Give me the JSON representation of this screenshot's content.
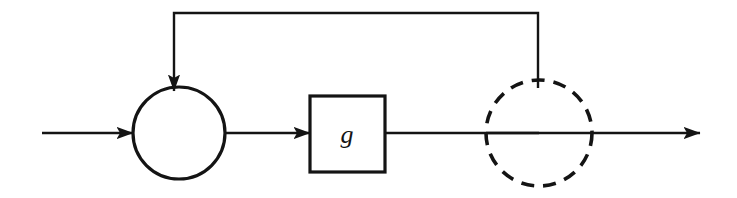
{
  "diagram": {
    "background_color": "#ffffff",
    "stroke_color": "#141414",
    "canvas": {
      "width": 737,
      "height": 198
    },
    "nodes": [
      {
        "id": "summing-junction",
        "type": "circle-solid",
        "role": "summing junction",
        "label": "",
        "cx": 179,
        "cy": 133,
        "r": 46,
        "stroke_width": 3.2,
        "stroke_style": "solid",
        "fill": "none"
      },
      {
        "id": "gain-block",
        "type": "rectangle",
        "role": "transfer function block",
        "label": "g",
        "x": 310,
        "y": 96,
        "width": 75,
        "height": 76,
        "stroke_width": 3.2,
        "stroke_style": "solid",
        "fill": "none"
      },
      {
        "id": "pickoff-point",
        "type": "circle-dashed",
        "role": "branch / pickoff point",
        "label": "",
        "cx": 539,
        "cy": 133,
        "r": 53,
        "stroke_width": 3.6,
        "stroke_style": "dashed",
        "dash_pattern": "13 9",
        "fill": "none"
      }
    ],
    "edges": [
      {
        "id": "input-edge",
        "from": "input",
        "to": "summing-junction",
        "arrowhead": true,
        "path": "M 42 133 L 133 133"
      },
      {
        "id": "summing-to-gain-edge",
        "from": "summing-junction",
        "to": "gain-block",
        "arrowhead": true,
        "path": "M 225 133 L 310 133"
      },
      {
        "id": "gain-to-pickoff-edge",
        "from": "gain-block",
        "to": "pickoff-point",
        "arrowhead": false,
        "path": "M 385 133 L 539 133"
      },
      {
        "id": "output-edge",
        "from": "pickoff-point",
        "to": "output",
        "arrowhead": true,
        "path": "M 486 133 L 700 133"
      },
      {
        "id": "feedback-edge",
        "from": "pickoff-point",
        "to": "summing-junction",
        "arrowhead": true,
        "path": "M 538 88 L 538 13 L 174 13 L 174 91"
      }
    ],
    "arrowhead": {
      "length": 17,
      "half_width": 6.5
    }
  }
}
